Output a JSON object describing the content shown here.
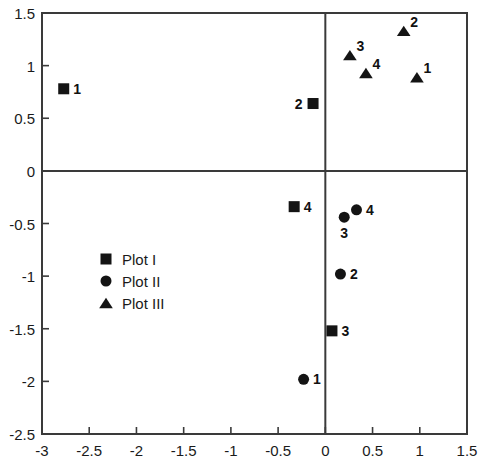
{
  "chart_data": {
    "type": "scatter",
    "title": "",
    "xlabel": "",
    "ylabel": "",
    "xlim": [
      -3,
      1.5
    ],
    "ylim": [
      -2.5,
      1.5
    ],
    "xticks": [
      -3,
      -2.5,
      -2,
      -1.5,
      -1,
      -0.5,
      0,
      0.5,
      1,
      1.5
    ],
    "xticklabels": [
      "-3",
      "-2.5",
      "-2",
      "-1.5",
      "-1",
      "-0.5",
      "0",
      "0.5",
      "1",
      "1.5"
    ],
    "yticks": [
      -2.5,
      -2,
      -1.5,
      -1,
      -0.5,
      0,
      0.5,
      1,
      1.5
    ],
    "yticklabels": [
      "-2.5",
      "-2",
      "-1.5",
      "-1",
      "-0.5",
      "0",
      "0.5",
      "1",
      "1.5"
    ],
    "grid": false,
    "zero_lines": true,
    "legend_position": "center-left-lower",
    "marker_color": "#141414",
    "axis_color": "#3a3a3a",
    "series": [
      {
        "name": "Plot I",
        "marker": "square",
        "points": [
          {
            "label": "1",
            "x": -2.77,
            "y": 0.78,
            "label_pos": "right"
          },
          {
            "label": "2",
            "x": -0.13,
            "y": 0.64,
            "label_pos": "left"
          },
          {
            "label": "4",
            "x": -0.33,
            "y": -0.34,
            "label_pos": "right"
          },
          {
            "label": "3",
            "x": 0.07,
            "y": -1.52,
            "label_pos": "right"
          }
        ]
      },
      {
        "name": "Plot II",
        "marker": "circle",
        "points": [
          {
            "label": "1",
            "x": -0.23,
            "y": -1.98,
            "label_pos": "right"
          },
          {
            "label": "2",
            "x": 0.16,
            "y": -0.98,
            "label_pos": "right"
          },
          {
            "label": "3",
            "x": 0.2,
            "y": -0.44,
            "label_pos": "below"
          },
          {
            "label": "4",
            "x": 0.33,
            "y": -0.37,
            "label_pos": "right"
          }
        ]
      },
      {
        "name": "Plot III",
        "marker": "triangle",
        "points": [
          {
            "label": "2",
            "x": 0.83,
            "y": 1.33,
            "label_pos": "upper-right"
          },
          {
            "label": "3",
            "x": 0.26,
            "y": 1.1,
            "label_pos": "upper-right"
          },
          {
            "label": "4",
            "x": 0.43,
            "y": 0.93,
            "label_pos": "upper-right"
          },
          {
            "label": "1",
            "x": 0.97,
            "y": 0.89,
            "label_pos": "upper-right"
          }
        ]
      }
    ],
    "legend": [
      {
        "marker": "square",
        "label": "Plot I"
      },
      {
        "marker": "circle",
        "label": "Plot II"
      },
      {
        "marker": "triangle",
        "label": "Plot III"
      }
    ]
  }
}
